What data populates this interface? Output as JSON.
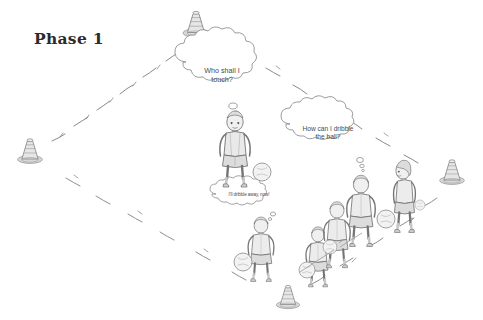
{
  "diagram": {
    "title": "Phase 1",
    "type": "sports-drill-sketch",
    "medium": "pencil-sketch-grayscale",
    "palette": {
      "background": "#ffffff",
      "ink": "#6f6f6f",
      "ink_dark": "#2b2b2b",
      "shade": "#cfcfcf",
      "shade_light": "#e4e4e4"
    },
    "playing_area": {
      "shape": "diamond",
      "line_style": "hand-drawn dashed",
      "corner_markers": "cones"
    },
    "cones": [
      {
        "id": "cone-top",
        "label": "cone",
        "x": 196,
        "y": 22
      },
      {
        "id": "cone-left",
        "label": "cone",
        "x": 30,
        "y": 149
      },
      {
        "id": "cone-right",
        "label": "cone",
        "x": 452,
        "y": 170
      },
      {
        "id": "cone-bottom",
        "label": "cone",
        "x": 288,
        "y": 295
      }
    ],
    "bubbles": [
      {
        "id": "bubble-who-shall-i-touch",
        "text": "Who shall I\ntouch?",
        "speaker": "player-center",
        "size": "large"
      },
      {
        "id": "bubble-how-can-i-dribble",
        "text": "How can I dribble\nthe ball?",
        "speaker": "player-right-tall",
        "size": "medium"
      },
      {
        "id": "bubble-ill-dribble-away",
        "text": "I'll dribble away, now!",
        "speaker": "player-lower-left",
        "size": "small"
      }
    ],
    "players": [
      {
        "id": "player-center",
        "label": "child player, facing viewer",
        "x": 235,
        "y": 148,
        "scale": 1.0,
        "pose": "front"
      },
      {
        "id": "player-lower-left",
        "label": "child player, back view",
        "x": 261,
        "y": 246,
        "scale": 0.86,
        "pose": "back"
      },
      {
        "id": "player-row-1",
        "label": "child player, back view",
        "x": 318,
        "y": 253,
        "scale": 0.8,
        "pose": "back"
      },
      {
        "id": "player-row-2",
        "label": "child player, back view",
        "x": 337,
        "y": 232,
        "scale": 0.88,
        "pose": "back"
      },
      {
        "id": "player-right-tall",
        "label": "child player, back view",
        "x": 361,
        "y": 208,
        "scale": 0.95,
        "pose": "back"
      },
      {
        "id": "player-far-right",
        "label": "child player, side view",
        "x": 404,
        "y": 193,
        "scale": 0.95,
        "pose": "side"
      }
    ],
    "balls": [
      {
        "id": "ball-center",
        "x": 262,
        "y": 172,
        "r": 9
      },
      {
        "id": "ball-lower-left",
        "x": 243,
        "y": 262,
        "r": 9
      },
      {
        "id": "ball-row-1",
        "x": 307,
        "y": 270,
        "r": 8
      },
      {
        "id": "ball-row-2",
        "x": 330,
        "y": 247,
        "r": 7
      },
      {
        "id": "ball-right",
        "x": 386,
        "y": 219,
        "r": 9
      },
      {
        "id": "ball-far-right",
        "x": 420,
        "y": 205,
        "r": 5
      }
    ]
  }
}
